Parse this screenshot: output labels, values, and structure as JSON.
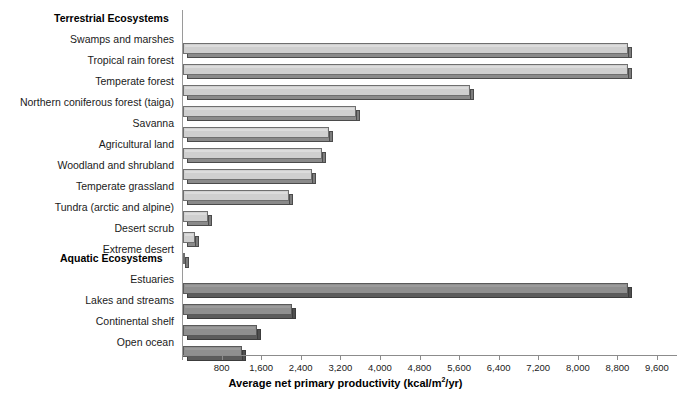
{
  "chart_data": {
    "type": "bar",
    "orientation": "horizontal",
    "title": "",
    "xlabel": "Average net primary productivity (kcal/m2/yr)",
    "ylabel": "",
    "xlim": [
      0,
      9600
    ],
    "xticks": [
      800,
      1600,
      2400,
      3200,
      4000,
      4800,
      5600,
      6400,
      7200,
      8000,
      8800,
      9600
    ],
    "xtick_labels": [
      "800",
      "1,600",
      "2,400",
      "3,200",
      "4,000",
      "4,800",
      "5,600",
      "6,400",
      "7,200",
      "8,000",
      "8,800",
      "9,600"
    ],
    "grid": false,
    "legend": "none",
    "groups": [
      {
        "name": "Terrestrial Ecosystems",
        "color": "#cfcfcf",
        "categories": [
          "Swamps and marshes",
          "Tropical rain forest",
          "Temperate forest",
          "Northern coniferous forest (taiga)",
          "Savanna",
          "Agricultural land",
          "Woodland and shrubland",
          "Temperate grassland",
          "Tundra (arctic and alpine)",
          "Desert scrub",
          "Extreme desert"
        ],
        "values": [
          9000,
          9000,
          5800,
          3500,
          2950,
          2800,
          2600,
          2150,
          500,
          250,
          50
        ]
      },
      {
        "name": "Aquatic Ecosystems",
        "color": "#8f8f8f",
        "categories": [
          "Estuaries",
          "Lakes and streams",
          "Continental shelf",
          "Open ocean"
        ],
        "values": [
          9000,
          2200,
          1500,
          1200
        ]
      }
    ]
  },
  "axis": {
    "title_main": "Average net primary productivity (kcal/m",
    "title_sup": "2",
    "title_tail": "/yr)"
  },
  "rows": [
    {
      "label": "Terrestrial Ecosystems",
      "kind": "group",
      "group": "terrestrial",
      "value": null,
      "top": 11
    },
    {
      "label": "Swamps and marshes",
      "kind": "bar",
      "group": "terrestrial",
      "value": 9000,
      "top": 32
    },
    {
      "label": "Tropical rain forest",
      "kind": "bar",
      "group": "terrestrial",
      "value": 9000,
      "top": 53
    },
    {
      "label": "Temperate forest",
      "kind": "bar",
      "group": "terrestrial",
      "value": 5800,
      "top": 74
    },
    {
      "label": "Northern coniferous forest (taiga)",
      "kind": "bar",
      "group": "terrestrial",
      "value": 3500,
      "top": 95
    },
    {
      "label": "Savanna",
      "kind": "bar",
      "group": "terrestrial",
      "value": 2950,
      "top": 116
    },
    {
      "label": "Agricultural land",
      "kind": "bar",
      "group": "terrestrial",
      "value": 2800,
      "top": 137
    },
    {
      "label": "Woodland and shrubland",
      "kind": "bar",
      "group": "terrestrial",
      "value": 2600,
      "top": 158
    },
    {
      "label": "Temperate grassland",
      "kind": "bar",
      "group": "terrestrial",
      "value": 2150,
      "top": 179
    },
    {
      "label": "Tundra (arctic and alpine)",
      "kind": "bar",
      "group": "terrestrial",
      "value": 500,
      "top": 200
    },
    {
      "label": "Desert scrub",
      "kind": "bar",
      "group": "terrestrial",
      "value": 250,
      "top": 221
    },
    {
      "label": "Extreme desert",
      "kind": "bar",
      "group": "terrestrial",
      "value": 50,
      "top": 242
    },
    {
      "label": "Aquatic Ecosystems",
      "kind": "group",
      "group": "aquatic",
      "value": null,
      "top": 251
    },
    {
      "label": "Estuaries",
      "kind": "bar",
      "group": "aquatic",
      "value": 9000,
      "top": 272
    },
    {
      "label": "Lakes and streams",
      "kind": "bar",
      "group": "aquatic",
      "value": 2200,
      "top": 293
    },
    {
      "label": "Continental shelf",
      "kind": "bar",
      "group": "aquatic",
      "value": 1500,
      "top": 314
    },
    {
      "label": "Open ocean",
      "kind": "bar",
      "group": "aquatic",
      "value": 1200,
      "top": 335
    }
  ]
}
